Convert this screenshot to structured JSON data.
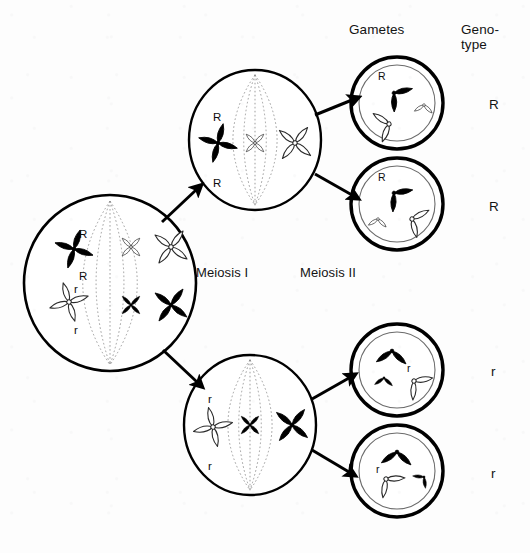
{
  "figure": {
    "width": 530,
    "height": 553,
    "background_color": "#fdfdfd",
    "ink_color": "#000000",
    "outline_color": "#111111"
  },
  "headers": {
    "gametes": "Gametes",
    "genotype_line1": "Geno-",
    "genotype_line2": "type"
  },
  "stage_labels": {
    "meiosis_1": "Meiosis I",
    "meiosis_2": "Meiosis II"
  },
  "parent_cell": {
    "name": "parent-cell",
    "cx": 110,
    "cy": 283,
    "rx": 86,
    "ry": 88,
    "allele_labels": [
      {
        "text": "R",
        "x": 79,
        "y": 228
      },
      {
        "text": "R",
        "x": 79,
        "y": 270
      },
      {
        "text": "r",
        "x": 74,
        "y": 283
      },
      {
        "text": "r",
        "x": 74,
        "y": 324
      }
    ],
    "chromosomes": [
      {
        "name": "chromosome-R-black",
        "fill": "black",
        "cx": 74,
        "cy": 249,
        "angle": -27,
        "size": 1.0
      },
      {
        "name": "chromosome-r-white",
        "cx": 69,
        "cy": 302,
        "angle": 28,
        "fill": "white",
        "size": 1.0
      },
      {
        "name": "chromosome-white-small",
        "cx": 131,
        "cy": 247,
        "angle": 0,
        "fill": "white",
        "size": 0.62
      },
      {
        "name": "chromosome-white-large",
        "cx": 171,
        "cy": 247,
        "angle": -8,
        "fill": "white",
        "size": 1.0
      },
      {
        "name": "chromosome-black-small",
        "cx": 131,
        "cy": 305,
        "angle": 0,
        "fill": "black",
        "size": 0.62
      },
      {
        "name": "chromosome-black-large",
        "cx": 171,
        "cy": 305,
        "angle": -8,
        "fill": "black",
        "size": 1.0
      }
    ]
  },
  "daughter_cells": [
    {
      "name": "daughter-cell-top",
      "cx": 255,
      "cy": 140,
      "rx": 66,
      "ry": 70,
      "allele_labels": [
        {
          "text": "R",
          "x": 213,
          "y": 111
        },
        {
          "text": "R",
          "x": 213,
          "y": 177
        }
      ],
      "chromosomes": [
        {
          "name": "chromosome-R-black",
          "fill": "black",
          "cx": 218,
          "cy": 143,
          "angle": -30,
          "size": 1.0
        },
        {
          "name": "chromosome-white-small",
          "cx": 255,
          "cy": 143,
          "angle": 0,
          "fill": "white",
          "size": 0.62
        },
        {
          "name": "chromosome-white-large",
          "cx": 295,
          "cy": 143,
          "angle": -6,
          "fill": "white",
          "size": 1.0
        }
      ]
    },
    {
      "name": "daughter-cell-bottom",
      "cx": 250,
      "cy": 425,
      "rx": 66,
      "ry": 70,
      "allele_labels": [
        {
          "text": "r",
          "x": 208,
          "y": 393
        },
        {
          "text": "r",
          "x": 208,
          "y": 460
        }
      ],
      "chromosomes": [
        {
          "name": "chromosome-r-white",
          "cx": 213,
          "cy": 427,
          "angle": 32,
          "fill": "white",
          "size": 1.0
        },
        {
          "name": "chromosome-black-small",
          "cx": 250,
          "cy": 425,
          "angle": 0,
          "fill": "black",
          "size": 0.62
        },
        {
          "name": "chromosome-black-large",
          "cx": 292,
          "cy": 425,
          "angle": -6,
          "fill": "black",
          "size": 1.0
        }
      ]
    }
  ],
  "gametes": [
    {
      "name": "gamete-cell-1",
      "cx": 397,
      "cy": 103,
      "r_outer": 46,
      "r_inner": 38,
      "genotype": "R",
      "genotype_x": 489,
      "genotype_y": 97,
      "allele_label": {
        "text": "R",
        "x": 378,
        "y": 70
      },
      "chromatids": [
        {
          "name": "chromatid-R-black",
          "fill": "black",
          "cx": 394,
          "cy": 93,
          "angle": -52,
          "size": 1.0
        },
        {
          "name": "chromatid-white-small",
          "fill": "white",
          "cx": 424,
          "cy": 105,
          "angle": 6,
          "size": 0.6
        },
        {
          "name": "chromatid-white-large",
          "fill": "white",
          "cx": 389,
          "cy": 124,
          "angle": 72,
          "size": 1.0
        }
      ]
    },
    {
      "name": "gamete-cell-2",
      "cx": 397,
      "cy": 204,
      "r_outer": 46,
      "r_inner": 38,
      "genotype": "R",
      "genotype_x": 489,
      "genotype_y": 199,
      "allele_label": {
        "text": "R",
        "x": 378,
        "y": 171
      },
      "chromatids": [
        {
          "name": "chromatid-R-black",
          "fill": "black",
          "cx": 394,
          "cy": 193,
          "angle": -48,
          "size": 1.0
        },
        {
          "name": "chromatid-white-small",
          "fill": "white",
          "cx": 378,
          "cy": 219,
          "angle": 6,
          "size": 0.6
        },
        {
          "name": "chromatid-white-large",
          "fill": "white",
          "cx": 412,
          "cy": 219,
          "angle": -66,
          "size": 1.0
        }
      ]
    },
    {
      "name": "gamete-cell-3",
      "cx": 397,
      "cy": 370,
      "r_outer": 46,
      "r_inner": 38,
      "genotype": "r",
      "genotype_x": 491,
      "genotype_y": 364,
      "allele_label": {
        "text": "r",
        "x": 407,
        "y": 362
      },
      "chromatids": [
        {
          "name": "chromatid-black-large",
          "fill": "black",
          "cx": 392,
          "cy": 351,
          "angle": 4,
          "size": 1.0
        },
        {
          "name": "chromatid-black-small",
          "fill": "black",
          "cx": 384,
          "cy": 378,
          "angle": 4,
          "size": 0.6
        },
        {
          "name": "chromatid-r-white",
          "fill": "white",
          "cx": 414,
          "cy": 381,
          "angle": -48,
          "size": 1.0
        }
      ]
    },
    {
      "name": "gamete-cell-4",
      "cx": 397,
      "cy": 471,
      "r_outer": 46,
      "r_inner": 38,
      "genotype": "r",
      "genotype_x": 491,
      "genotype_y": 466,
      "allele_label": {
        "text": "r",
        "x": 376,
        "y": 463
      },
      "chromatids": [
        {
          "name": "chromatid-black-large",
          "fill": "black",
          "cx": 397,
          "cy": 452,
          "angle": 4,
          "size": 1.0
        },
        {
          "name": "chromatid-black-small",
          "fill": "black",
          "cx": 424,
          "cy": 477,
          "angle": 44,
          "size": 0.6
        },
        {
          "name": "chromatid-r-white",
          "fill": "white",
          "cx": 386,
          "cy": 479,
          "angle": -42,
          "size": 1.0
        }
      ]
    }
  ],
  "arrows": [
    {
      "name": "arrow-parent-to-top-daughter",
      "x1": 162,
      "y1": 222,
      "x2": 196,
      "y2": 190
    },
    {
      "name": "arrow-parent-to-bottom-daughter",
      "x1": 163,
      "y1": 350,
      "x2": 197,
      "y2": 382
    },
    {
      "name": "arrow-top-daughter-to-gamete-1",
      "x1": 315,
      "y1": 115,
      "x2": 352,
      "y2": 100
    },
    {
      "name": "arrow-top-daughter-to-gamete-2",
      "x1": 315,
      "y1": 174,
      "x2": 352,
      "y2": 195
    },
    {
      "name": "arrow-bottom-daughter-to-gamete-3",
      "x1": 312,
      "y1": 399,
      "x2": 349,
      "y2": 378
    },
    {
      "name": "arrow-bottom-daughter-to-gamete-4",
      "x1": 312,
      "y1": 450,
      "x2": 349,
      "y2": 472
    }
  ]
}
